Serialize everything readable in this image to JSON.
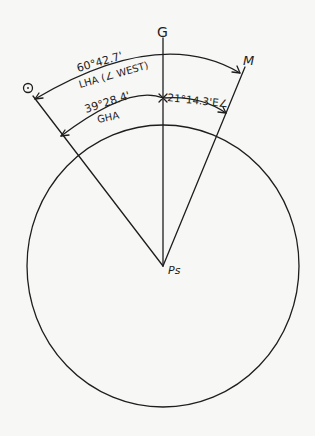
{
  "diagram": {
    "type": "celestial hour-angle diagram",
    "points": {
      "observer": "O",
      "greenwich": "G",
      "body_meridian": "M",
      "pole": "Ps"
    },
    "arcs": {
      "lha_value": "60°42.7'",
      "lha_label": "LHA (∠ WEST)",
      "gha_value": "39°28.4'",
      "gha_label": "GHA",
      "east_value": "21°14.3'E∠"
    },
    "colors": {
      "ink": "#1e1e1e",
      "paper": "#f7f7f5"
    }
  }
}
